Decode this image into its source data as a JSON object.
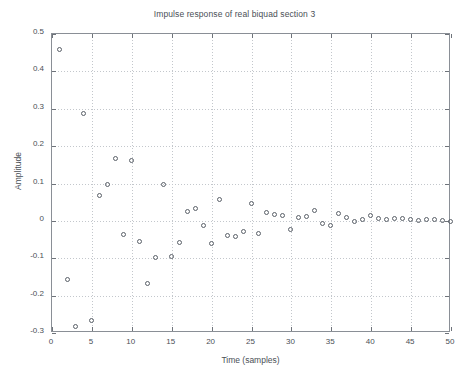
{
  "chart_data": {
    "type": "scatter",
    "title": "Impulse response of real biquad section 3",
    "xlabel": "Time (samples)",
    "ylabel": "Amplitude",
    "xlim": [
      0,
      50
    ],
    "ylim": [
      -0.3,
      0.5
    ],
    "xticks": [
      0,
      5,
      10,
      15,
      20,
      25,
      30,
      35,
      40,
      45,
      50
    ],
    "xticklabels": [
      "0",
      "5",
      "10",
      "15",
      "20",
      "25",
      "30",
      "35",
      "40",
      "45",
      "50"
    ],
    "yticks": [
      -0.3,
      -0.2,
      -0.1,
      0,
      0.1,
      0.2,
      0.3,
      0.4,
      0.5
    ],
    "yticklabels": [
      "-0.3",
      "-0.2",
      "-0.1",
      "0",
      "0.1",
      "0.2",
      "0.3",
      "0.4",
      "0.5"
    ],
    "grid": true,
    "legend": null,
    "marker": "open-circle",
    "marker_color": "#5a6068",
    "series": [
      {
        "name": "impulse response",
        "x": [
          1,
          2,
          3,
          4,
          5,
          6,
          7,
          8,
          9,
          10,
          11,
          12,
          13,
          14,
          15,
          16,
          17,
          18,
          19,
          20,
          21,
          22,
          23,
          24,
          25,
          26,
          27,
          28,
          29,
          30,
          31,
          32,
          33,
          34,
          35,
          36,
          37,
          38,
          39,
          40,
          41,
          42,
          43,
          44,
          45,
          46,
          47,
          48,
          49,
          50
        ],
        "values": [
          0.458,
          -0.158,
          -0.283,
          0.285,
          -0.268,
          0.067,
          0.097,
          0.166,
          -0.038,
          0.16,
          -0.056,
          -0.17,
          -0.1,
          0.097,
          -0.097,
          -0.058,
          0.025,
          0.033,
          -0.013,
          -0.061,
          0.057,
          -0.04,
          -0.043,
          -0.029,
          0.044,
          -0.035,
          0.02,
          0.017,
          0.013,
          -0.024,
          0.009,
          0.01,
          0.027,
          -0.009,
          -0.013,
          0.018,
          0.008,
          -0.004,
          0.002,
          0.012,
          0.005,
          0.002,
          0.004,
          0.006,
          0.002,
          0.001,
          0.003,
          0.002,
          0.001,
          -0.002
        ]
      }
    ]
  }
}
